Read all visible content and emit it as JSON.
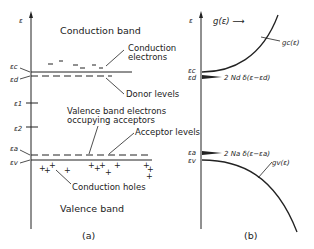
{
  "panel_a": {
    "caption": "(a)",
    "axis_label": "ε",
    "labels": {
      "conduction_band": "Conduction band",
      "conduction_electrons_1": "Conduction",
      "conduction_electrons_2": "electrons",
      "donor_levels": "Donor levels",
      "valence_electrons_1": "Valence band electrons",
      "valence_electrons_2": "occupying acceptors",
      "acceptor_levels": "Acceptor levels",
      "conduction_holes": "Conduction holes",
      "valence_band": "Valence band"
    },
    "energy_levels": {
      "ec": "εc",
      "ed": "εd",
      "e1": "ε1",
      "e2": "ε2",
      "ea": "εa",
      "ev": "εv"
    },
    "charge_symbols": {
      "electron": "−",
      "hole": "+"
    }
  },
  "panel_b": {
    "caption": "(b)",
    "axis_label": "ε",
    "x_label": "g(ε) ⟶",
    "curves": {
      "gc": "gc(ε)",
      "gv": "gv(ε)"
    },
    "delta_labels": {
      "donor": "2 Nd δ(ε−εd)",
      "acceptor": "2 Na δ(ε−εa)"
    },
    "energy_levels": {
      "ec": "εc",
      "ed": "εd",
      "ea": "εa",
      "ev": "εv"
    }
  },
  "colors": {
    "ink": "#222222",
    "background": "#ffffff"
  }
}
